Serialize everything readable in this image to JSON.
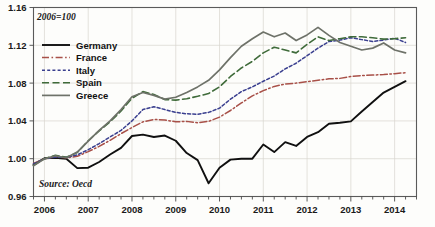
{
  "chart_data": {
    "type": "line",
    "title": "",
    "subtitle": "",
    "annotation": "2006=100",
    "source_note": "Source: Oecd",
    "xlabel": "",
    "ylabel": "",
    "xlim": [
      2005.75,
      2014.5
    ],
    "ylim": [
      0.96,
      1.16
    ],
    "yticks": [
      "0.96",
      "1.00",
      "1.04",
      "1.08",
      "1.12",
      "1.16"
    ],
    "ytick_values": [
      0.96,
      1.0,
      1.04,
      1.08,
      1.12,
      1.16
    ],
    "xticks": [
      "2006",
      "2007",
      "2008",
      "2009",
      "2010",
      "2011",
      "2012",
      "2013",
      "2014"
    ],
    "xtick_values": [
      2006,
      2007,
      2008,
      2009,
      2010,
      2011,
      2012,
      2013,
      2014
    ],
    "grid": true,
    "legend_position": "top-left",
    "x": [
      2005.75,
      2006.0,
      2006.25,
      2006.5,
      2006.75,
      2007.0,
      2007.25,
      2007.5,
      2007.75,
      2008.0,
      2008.25,
      2008.5,
      2008.75,
      2009.0,
      2009.25,
      2009.5,
      2009.75,
      2010.0,
      2010.25,
      2010.5,
      2010.75,
      2011.0,
      2011.25,
      2011.5,
      2011.75,
      2012.0,
      2012.25,
      2012.5,
      2012.75,
      2013.0,
      2013.25,
      2013.5,
      2013.75,
      2014.0,
      2014.25
    ],
    "series": [
      {
        "name": "Germany",
        "color": "#101010",
        "dash": "none",
        "width": 1.9,
        "values": [
          0.9935,
          1.0005,
          1.001,
          1.0,
          0.99,
          0.9905,
          0.9965,
          1.0045,
          1.0115,
          1.024,
          1.0255,
          1.023,
          1.0245,
          1.019,
          1.006,
          0.9985,
          0.974,
          0.9905,
          0.999,
          1.0,
          1.0,
          1.015,
          1.007,
          1.0175,
          1.0135,
          1.023,
          1.028,
          1.037,
          1.038,
          1.0395,
          1.05,
          1.06,
          1.07,
          1.076,
          1.082
        ]
      },
      {
        "name": "France",
        "color": "#a85048",
        "dash": "dashdot",
        "width": 1.5,
        "values": [
          0.995,
          1.0,
          1.002,
          1.001,
          1.0025,
          1.0075,
          1.013,
          1.0195,
          1.0265,
          1.033,
          1.039,
          1.0415,
          1.041,
          1.039,
          1.0395,
          1.038,
          1.0395,
          1.044,
          1.051,
          1.059,
          1.0665,
          1.072,
          1.0765,
          1.079,
          1.08,
          1.0815,
          1.083,
          1.0845,
          1.085,
          1.087,
          1.088,
          1.0885,
          1.089,
          1.09,
          1.091
        ]
      },
      {
        "name": "Italy",
        "color": "#3a3f8f",
        "dash": "dotted",
        "width": 1.5,
        "values": [
          0.9945,
          1.0,
          1.0015,
          1.0015,
          1.004,
          1.0095,
          1.016,
          1.023,
          1.03,
          1.04,
          1.052,
          1.055,
          1.052,
          1.049,
          1.0475,
          1.047,
          1.049,
          1.0535,
          1.063,
          1.071,
          1.076,
          1.082,
          1.0875,
          1.095,
          1.101,
          1.109,
          1.117,
          1.124,
          1.1255,
          1.128,
          1.126,
          1.124,
          1.1255,
          1.1275,
          1.123
        ]
      },
      {
        "name": "Spain",
        "color": "#3f6b3a",
        "dash": "dashed",
        "width": 1.6,
        "values": [
          0.993,
          1.0,
          1.0035,
          1.0015,
          1.0065,
          1.019,
          1.0295,
          1.039,
          1.0505,
          1.064,
          1.071,
          1.068,
          1.0625,
          1.062,
          1.0635,
          1.066,
          1.069,
          1.076,
          1.087,
          1.096,
          1.103,
          1.112,
          1.118,
          1.115,
          1.112,
          1.121,
          1.129,
          1.125,
          1.127,
          1.129,
          1.129,
          1.128,
          1.1265,
          1.127,
          1.128
        ]
      },
      {
        "name": "Greece",
        "color": "#6e7269",
        "dash": "none",
        "width": 1.7,
        "values": [
          0.9925,
          1.0,
          1.003,
          1.001,
          1.007,
          1.0185,
          1.03,
          1.04,
          1.052,
          1.0655,
          1.07,
          1.067,
          1.063,
          1.065,
          1.07,
          1.076,
          1.083,
          1.094,
          1.107,
          1.119,
          1.127,
          1.134,
          1.129,
          1.133,
          1.125,
          1.131,
          1.139,
          1.1305,
          1.123,
          1.119,
          1.115,
          1.117,
          1.1225,
          1.115,
          1.112
        ]
      }
    ]
  },
  "legend": {
    "items": [
      {
        "label": "Germany"
      },
      {
        "label": "France"
      },
      {
        "label": "Italy"
      },
      {
        "label": "Spain"
      },
      {
        "label": "Greece"
      }
    ]
  },
  "colors": {
    "germany": "#101010",
    "france": "#a85048",
    "italy": "#3a3f8f",
    "spain": "#3f6b3a",
    "greece": "#6e7269",
    "grid": "#d9d6cf",
    "frame": "#5a5a5a",
    "background": "#fdfdfb"
  }
}
